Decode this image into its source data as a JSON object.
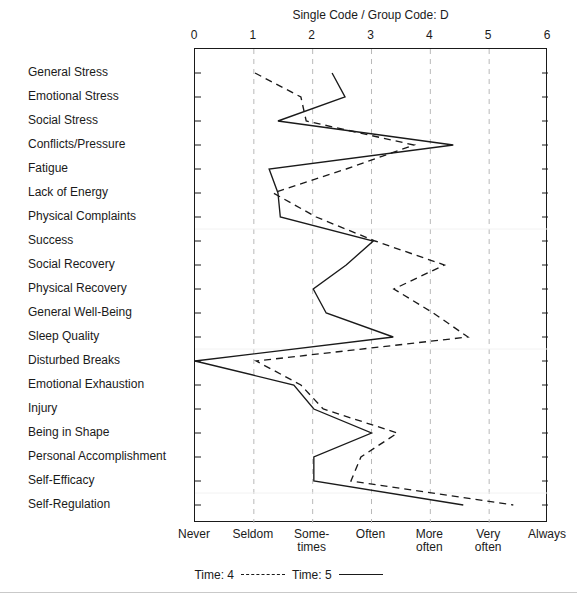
{
  "chart_data": {
    "type": "line",
    "title": "Single Code / Group Code: D",
    "orientation": "horizontal",
    "xlabel": "",
    "ylabel": "",
    "xlim": [
      0,
      6
    ],
    "x_ticks": [
      "0",
      "1",
      "2",
      "3",
      "4",
      "5",
      "6"
    ],
    "x_tick_values": [
      0,
      1,
      2,
      3,
      4,
      5,
      6
    ],
    "x_category_labels": [
      "Never",
      "Seldom",
      "Some-\ntimes",
      "Often",
      "More\noften",
      "Very\noften",
      "Always"
    ],
    "grid": "vertical-dashed",
    "legend_position": "bottom-center",
    "categories": [
      "General Stress",
      "Emotional Stress",
      "Social Stress",
      "Conflicts/Pressure",
      "Fatigue",
      "Lack of Energy",
      "Physical Complaints",
      "Success",
      "Social Recovery",
      "Physical Recovery",
      "General Well-Being",
      "Sleep Quality",
      "Disturbed Breaks",
      "Emotional Exhaustion",
      "Injury",
      "Being in Shape",
      "Personal Accomplishment",
      "Self-Efficacy",
      "Self-Regulation"
    ],
    "series": [
      {
        "name": "Time: 4",
        "style": "dashed",
        "color": "#1a1a1a",
        "values": [
          1.02,
          1.8,
          1.89,
          3.72,
          2.57,
          1.33,
          2.06,
          3.06,
          4.24,
          3.38,
          4.05,
          4.64,
          1.04,
          1.8,
          2.18,
          3.44,
          2.82,
          2.65,
          5.41
        ]
      },
      {
        "name": "Time: 5",
        "style": "solid",
        "color": "#1a1a1a",
        "values": [
          2.33,
          2.55,
          1.41,
          4.39,
          1.26,
          1.41,
          1.45,
          3.03,
          2.57,
          2.01,
          2.23,
          3.37,
          0.0,
          1.68,
          2.02,
          3.0,
          2.02,
          2.02,
          4.56
        ]
      }
    ]
  },
  "legend": {
    "items": [
      {
        "label": "Time: 4",
        "style": "dashed"
      },
      {
        "label": "Time: 5",
        "style": "solid"
      }
    ]
  }
}
